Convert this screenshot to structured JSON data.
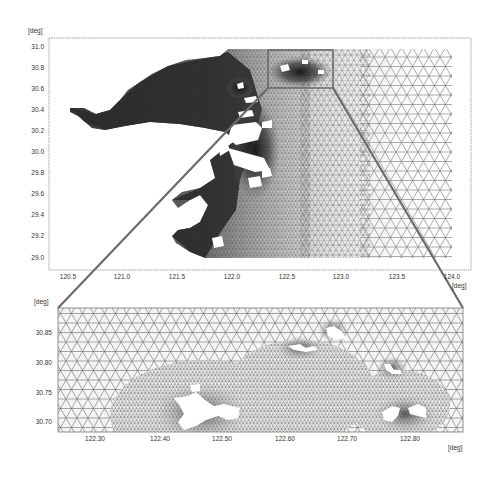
{
  "figure": {
    "connector_color": "#6b6b6b",
    "mesh_color": "#555555",
    "land_color": "#ffffff"
  },
  "upper_plot": {
    "y_unit": "[deg]",
    "x_unit": "[deg]",
    "y_ticks": [
      "31.0",
      "30.8",
      "30.6",
      "30.4",
      "30.2",
      "30.0",
      "29.8",
      "29.6",
      "29.4",
      "29.2",
      "29.0"
    ],
    "x_ticks": [
      "120.5",
      "121.0",
      "121.5",
      "122.0",
      "122.5",
      "123.0",
      "123.5",
      "124.0"
    ],
    "x_range": [
      120.4,
      124.1
    ],
    "y_range": [
      28.9,
      31.05
    ],
    "zoom_box": {
      "x_range": [
        122.3,
        122.88
      ],
      "y_range": [
        30.69,
        30.88
      ]
    }
  },
  "lower_plot": {
    "y_unit": "[deg]",
    "x_unit": "[deg]",
    "y_ticks": [
      "30.85",
      "30.80",
      "30.75",
      "30.70"
    ],
    "x_ticks": [
      "122.30",
      "122.40",
      "122.50",
      "122.60",
      "122.70",
      "122.80"
    ],
    "x_range": [
      122.24,
      122.88
    ],
    "y_range": [
      30.69,
      30.89
    ]
  }
}
